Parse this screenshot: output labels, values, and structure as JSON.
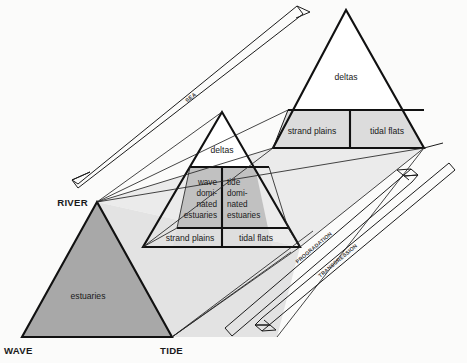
{
  "figure": {
    "type": "ternary-classification-diagram",
    "title": "",
    "background_color": "#fbfbfa"
  },
  "colors": {
    "outline": "#111111",
    "dark_fill": "#a8a8a8",
    "mid_fill": "#c4c4c4",
    "light_fill": "#dcdcdc",
    "pale_fill": "#e8e8e8",
    "white_fill": "#ffffff",
    "text": "#1a1a1a"
  },
  "apex_labels": [
    {
      "name": "wave",
      "text": "WAVE",
      "x": 5,
      "y": 352
    },
    {
      "name": "tide",
      "text": "TIDE",
      "x": 160,
      "y": 352
    },
    {
      "name": "river",
      "text": "RIVER",
      "x": 30,
      "y": 207
    }
  ],
  "axis_arrows": [
    {
      "name": "sea-level-axis",
      "label": "SEA",
      "direction": "down-left",
      "label_x": 192,
      "label_y": 99,
      "label_rotation": -41
    },
    {
      "name": "progradation-axis",
      "label": "PROGRADATION",
      "direction": "up-right",
      "label_x": 300,
      "label_y": 260,
      "label_rotation": -41
    },
    {
      "name": "transgression-axis",
      "label": "TRANSGRESSION",
      "direction": "down-left",
      "label_x": 324,
      "label_y": 272,
      "label_rotation": -41
    }
  ],
  "triangles": [
    {
      "name": "front-triangle",
      "position": "lower-left",
      "fill": "dark",
      "regions": [
        {
          "name": "estuaries",
          "label": "estuaries",
          "label_x": 87,
          "label_y": 296
        }
      ]
    },
    {
      "name": "middle-triangle",
      "position": "center",
      "fill": "mid",
      "regions": [
        {
          "name": "deltas",
          "label": "deltas",
          "label_x": 222,
          "label_y": 151
        },
        {
          "name": "wave-dominated-estuaries",
          "label_lines": [
            "wave",
            "domi-",
            "nated",
            "estuaries"
          ],
          "label_x": 196,
          "label_y": 190
        },
        {
          "name": "tide-dominated-estuaries",
          "label_lines": [
            "tide",
            "domi-",
            "nated",
            "estuaries"
          ],
          "label_x": 228,
          "label_y": 190
        },
        {
          "name": "strand-plains",
          "label": "strand plains",
          "label_x": 188,
          "label_y": 239
        },
        {
          "name": "tidal-flats",
          "label": "tidal flats",
          "label_x": 258,
          "label_y": 239
        }
      ]
    },
    {
      "name": "back-triangle",
      "position": "upper-right",
      "fill": "light",
      "regions": [
        {
          "name": "deltas",
          "label": "deltas",
          "label_x": 346,
          "label_y": 77
        },
        {
          "name": "strand-plains",
          "label": "strand plains",
          "label_x": 308,
          "label_y": 132
        },
        {
          "name": "tidal-flats",
          "label": "tidal flats",
          "label_x": 385,
          "label_y": 132
        }
      ]
    }
  ],
  "texts": {
    "deltas": "deltas",
    "estuaries": "estuaries",
    "strand_plains": "strand plains",
    "tidal_flats": "tidal flats",
    "wave_dom_1": "wave",
    "wave_dom_2": "domi-",
    "wave_dom_3": "nated",
    "wave_dom_4": "estuaries",
    "tide_dom_1": "tide",
    "tide_dom_2": "domi-",
    "tide_dom_3": "nated",
    "tide_dom_4": "estuaries",
    "wave_apex": "WAVE",
    "tide_apex": "TIDE",
    "river_apex": "RIVER",
    "axis_sea": "SEA",
    "axis_prograd": "PROGRADATION",
    "axis_transgress": "TRANSGRESSION"
  }
}
